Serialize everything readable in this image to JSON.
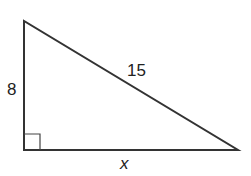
{
  "diagram": {
    "type": "right-triangle",
    "vertices": {
      "top": [
        24,
        21
      ],
      "right_angle": [
        24,
        150
      ],
      "right": [
        238,
        150
      ]
    },
    "sides": {
      "vertical_leg": {
        "label": "8"
      },
      "hypotenuse": {
        "label": "15"
      },
      "horizontal_leg": {
        "label": "x"
      }
    },
    "right_angle_marker": true,
    "colors": {
      "stroke": "#333333",
      "text": "#222222",
      "background": "#ffffff"
    }
  }
}
